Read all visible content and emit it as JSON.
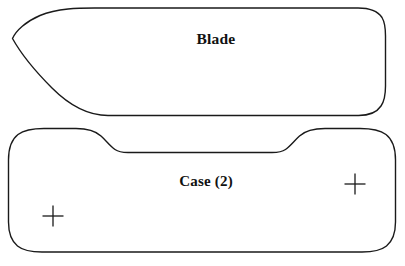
{
  "diagram": {
    "background_color": "#ffffff",
    "line_color": "#1a1a1a",
    "pieces": [
      {
        "id": "blade",
        "label": "Blade",
        "label_x": 216,
        "label_y": 39,
        "description": "elongated blade pattern piece with pointed left tip and rounded right end",
        "path": "M 12.5 38.5 C 16 30.5 26 21.5 40 15.5 C 58 7.8 80 8.0 96 8.0 L 358 8.0 C 370 8.0 378 11.5 382 17.5 C 385 22.5 385.5 28 385.5 36 L 385.5 86 C 385.5 95 384.5 101 381 106 C 377 112 370 115.5 358.5 115.5 L 108 115.5 C 88 115.5 70 106 52 88 C 34 70 20 52 12.5 38.5 Z"
      },
      {
        "id": "case",
        "label": "Case (2)",
        "label_x": 206,
        "label_y": 181,
        "description": "rounded rectangular case pattern piece with a stepped recess along the top edge",
        "path": "M 8.5 160 C 8.5 148 11.5 139.5 18 134.5 C 24 130 32 128.5 44 128.5 L 76 128.5 C 88 128.5 95 130.5 101 136 C 106 140.5 110 146 115 149.5 C 118.5 152 122 152.5 128 152.5 L 272 152.5 C 278 152.5 282 152 285.5 149.5 C 290.5 146 294.5 140.5 299.5 136 C 305.5 130.5 313 128.5 325 128.5 L 360 128.5 C 372 128.5 380 130 386 134.5 C 392.5 139.5 395.5 148 395.5 160 L 395.5 222 C 395.5 233 392.5 241 386.5 246 C 381 250.5 373.5 252 362 252 L 42 252 C 30.5 252 23 250.5 17.5 246 C 11.5 241 8.5 233 8.5 222 Z"
      }
    ],
    "registration_marks": [
      {
        "id": "mark-case-left",
        "cx": 53,
        "cy": 216,
        "size": 21
      },
      {
        "id": "mark-case-right",
        "cx": 355,
        "cy": 184,
        "size": 21
      }
    ]
  }
}
